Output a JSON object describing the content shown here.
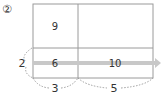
{
  "problem": {
    "number_label": "②"
  },
  "grid": {
    "cells": [
      {
        "row": 0,
        "col": 0,
        "value": "9"
      },
      {
        "row": 0,
        "col": 1,
        "value": ""
      },
      {
        "row": 1,
        "col": 0,
        "value": "6"
      },
      {
        "row": 1,
        "col": 1,
        "value": "10"
      }
    ],
    "side_label": "2",
    "bottom_labels": [
      "3",
      "5"
    ]
  },
  "colors": {
    "line": "#9a9a9a",
    "arrow": "#c8c8c8",
    "text": "#333333"
  }
}
